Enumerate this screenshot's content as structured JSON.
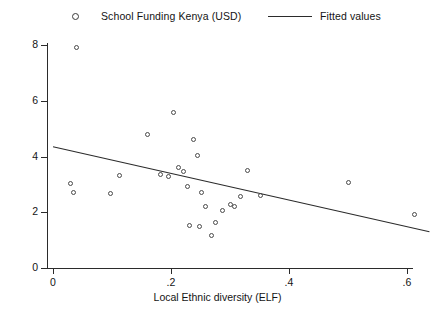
{
  "chart_data": {
    "type": "scatter",
    "title": "",
    "xlabel": "Local Ethnic diversity (ELF)",
    "ylabel": "",
    "xlim": [
      -0.02,
      0.66
    ],
    "ylim": [
      0,
      8.6
    ],
    "grid": false,
    "legend_position": "top",
    "legend": [
      {
        "label": "School Funding Kenya (USD)",
        "marker": "circle-open"
      },
      {
        "label": "Fitted values",
        "marker": "line"
      }
    ],
    "xticks": [
      0,
      0.2,
      0.4,
      0.6
    ],
    "xtick_labels": [
      "0",
      ".2",
      ".4",
      ".6"
    ],
    "yticks": [
      0,
      2,
      4,
      6,
      8
    ],
    "ytick_labels": [
      "0",
      "2",
      "4",
      "6",
      "8"
    ],
    "series": [
      {
        "name": "School Funding Kenya (USD)",
        "marker": "circle-open",
        "points": [
          [
            0.04,
            7.9
          ],
          [
            0.03,
            3.02
          ],
          [
            0.035,
            2.7
          ],
          [
            0.098,
            2.68
          ],
          [
            0.112,
            3.32
          ],
          [
            0.16,
            4.78
          ],
          [
            0.182,
            3.35
          ],
          [
            0.196,
            3.3
          ],
          [
            0.205,
            5.58
          ],
          [
            0.212,
            3.62
          ],
          [
            0.222,
            3.45
          ],
          [
            0.228,
            2.92
          ],
          [
            0.232,
            1.52
          ],
          [
            0.238,
            4.62
          ],
          [
            0.245,
            4.05
          ],
          [
            0.248,
            1.48
          ],
          [
            0.252,
            2.72
          ],
          [
            0.258,
            2.22
          ],
          [
            0.268,
            1.18
          ],
          [
            0.276,
            1.62
          ],
          [
            0.288,
            2.05
          ],
          [
            0.3,
            2.28
          ],
          [
            0.308,
            2.2
          ],
          [
            0.318,
            2.58
          ],
          [
            0.33,
            3.5
          ],
          [
            0.352,
            2.6
          ],
          [
            0.5,
            3.05
          ],
          [
            0.612,
            1.92
          ]
        ]
      }
    ],
    "fit_line": {
      "name": "Fitted values",
      "x_start": 0.0,
      "y_start": 4.35,
      "x_end": 0.638,
      "y_end": 1.3
    }
  }
}
